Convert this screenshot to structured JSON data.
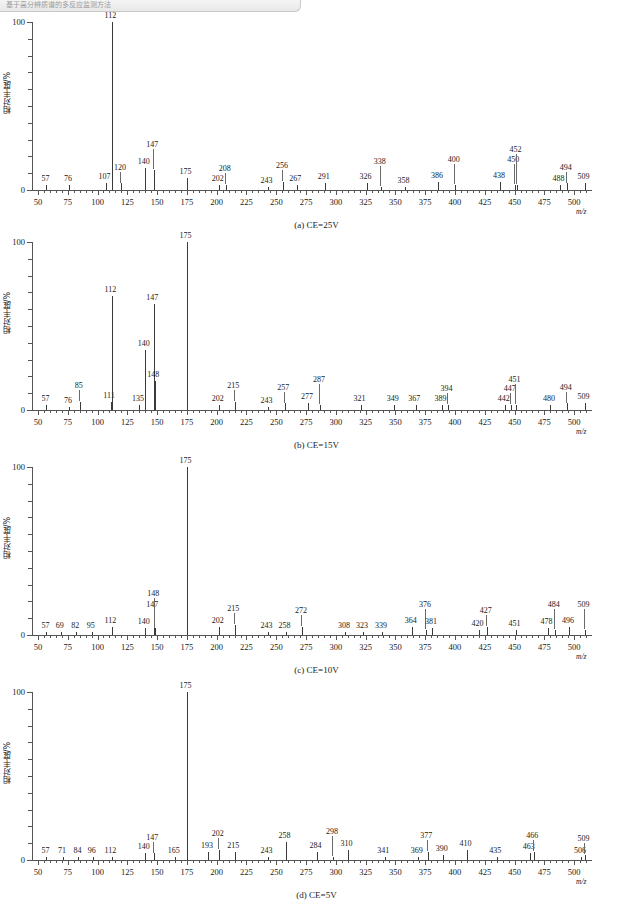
{
  "header": {
    "text": "基于高分辨质谱的多反应监测方法"
  },
  "axes": {
    "y_label": "相对丰度/%",
    "y_ticks": [
      "0",
      "100"
    ],
    "y_min": 0,
    "y_max": 100,
    "x_label": "m/z",
    "x_ticks": [
      "50",
      "75",
      "100",
      "125",
      "150",
      "175",
      "200",
      "225",
      "250",
      "275",
      "300",
      "325",
      "350",
      "375",
      "400",
      "425",
      "450",
      "475",
      "500"
    ],
    "x_min": 45,
    "x_max": 515
  },
  "chart_data": [
    {
      "type": "bar",
      "title": "(a) CE=25V",
      "xlabel": "m/z",
      "ylabel": "相对丰度/%",
      "ylim": [
        0,
        100
      ],
      "xlim": [
        45,
        515
      ],
      "categories": [
        57,
        76,
        107,
        112,
        120,
        140,
        147,
        175,
        202,
        208,
        243,
        256,
        267,
        291,
        326,
        338,
        358,
        386,
        400,
        438,
        450,
        452,
        488,
        494,
        509
      ],
      "values": [
        3,
        3,
        4,
        100,
        4,
        13,
        12,
        7,
        3,
        3,
        2,
        5,
        3,
        4,
        4,
        2,
        2,
        5,
        3,
        5,
        3,
        3,
        3,
        4,
        4
      ]
    },
    {
      "type": "bar",
      "title": "(b) CE=15V",
      "xlabel": "m/z",
      "ylabel": "相对丰度/%",
      "ylim": [
        0,
        100
      ],
      "xlim": [
        45,
        515
      ],
      "categories": [
        57,
        76,
        85,
        111,
        112,
        135,
        140,
        147,
        148,
        175,
        202,
        215,
        243,
        257,
        277,
        287,
        321,
        349,
        367,
        389,
        394,
        442,
        447,
        451,
        480,
        494,
        509
      ],
      "values": [
        3,
        2,
        5,
        5,
        68,
        3,
        36,
        63,
        17,
        100,
        3,
        5,
        2,
        4,
        4,
        3,
        3,
        3,
        3,
        3,
        3,
        3,
        3,
        3,
        3,
        4,
        4
      ]
    },
    {
      "type": "bar",
      "title": "(c) CE=10V",
      "xlabel": "m/z",
      "ylabel": "相对丰度/%",
      "ylim": [
        0,
        100
      ],
      "xlim": [
        45,
        515
      ],
      "categories": [
        57,
        69,
        82,
        95,
        112,
        140,
        147,
        148,
        175,
        202,
        215,
        243,
        258,
        272,
        308,
        323,
        339,
        364,
        376,
        381,
        420,
        427,
        451,
        478,
        484,
        496,
        509
      ],
      "values": [
        2,
        2,
        2,
        2,
        5,
        4,
        14,
        4,
        100,
        5,
        6,
        2,
        2,
        5,
        2,
        2,
        2,
        5,
        3,
        4,
        3,
        5,
        3,
        4,
        3,
        5,
        3
      ]
    },
    {
      "type": "bar",
      "title": "(d) CE=5V",
      "xlabel": "m/z",
      "ylabel": "相对丰度/%",
      "ylim": [
        0,
        100
      ],
      "xlim": [
        45,
        515
      ],
      "categories": [
        57,
        71,
        84,
        96,
        112,
        140,
        147,
        165,
        175,
        193,
        202,
        215,
        243,
        258,
        284,
        298,
        310,
        341,
        369,
        377,
        390,
        410,
        435,
        463,
        466,
        506,
        509
      ],
      "values": [
        2,
        2,
        2,
        2,
        2,
        4,
        4,
        2,
        100,
        5,
        6,
        5,
        2,
        11,
        5,
        2,
        6,
        2,
        2,
        5,
        3,
        6,
        2,
        4,
        5,
        2,
        3
      ]
    }
  ]
}
